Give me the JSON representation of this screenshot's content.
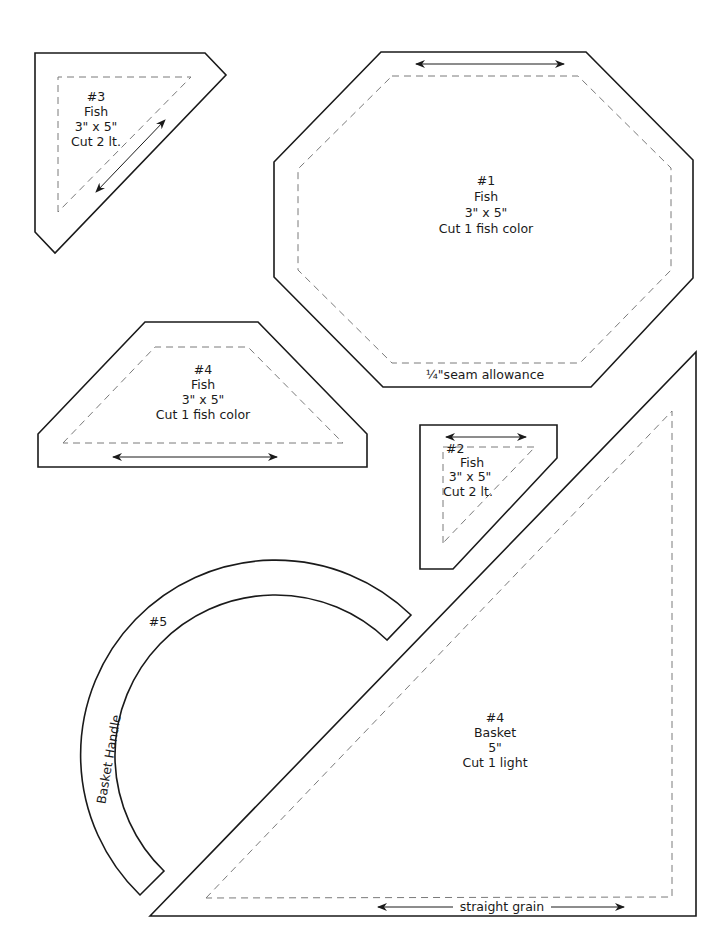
{
  "pieces": {
    "p3": {
      "number": "#3",
      "name": "Fish",
      "size": "3\" x 5\"",
      "cut": "Cut 2 lt."
    },
    "p1": {
      "number": "#1",
      "name": "Fish",
      "size": "3\" x 5\"",
      "cut": "Cut 1 fish color",
      "note": "¼\"seam allowance"
    },
    "p4fish": {
      "number": "#4",
      "name": "Fish",
      "size": "3\" x 5\"",
      "cut": "Cut 1 fish color"
    },
    "p2": {
      "number": "#2",
      "name": "Fish",
      "size": "3\" x 5\"",
      "cut": "Cut 2 lt."
    },
    "p5": {
      "number": "#5",
      "name": "Basket Handle"
    },
    "p4basket": {
      "number": "#4",
      "name": "Basket",
      "size": "5\"",
      "cut": "Cut 1 light",
      "grain": "straight grain"
    }
  },
  "colors": {
    "line": "#1a1a1a",
    "seam": "#7a7a7a",
    "background": "#ffffff"
  }
}
